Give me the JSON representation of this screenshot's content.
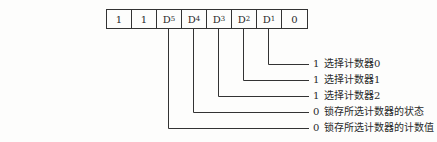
{
  "register": {
    "bits": [
      {
        "main": "1",
        "sub": ""
      },
      {
        "main": "1",
        "sub": ""
      },
      {
        "main": "D",
        "sub": "5"
      },
      {
        "main": "D",
        "sub": "4"
      },
      {
        "main": "D",
        "sub": "3"
      },
      {
        "main": "D",
        "sub": "2"
      },
      {
        "main": "D",
        "sub": "1"
      },
      {
        "main": "0",
        "sub": ""
      }
    ]
  },
  "annotations": [
    {
      "bit": "D1",
      "value": "1",
      "text": "选择计数器0"
    },
    {
      "bit": "D2",
      "value": "1",
      "text": "选择计数器1"
    },
    {
      "bit": "D3",
      "value": "1",
      "text": "选择计数器2"
    },
    {
      "bit": "D4",
      "value": "0",
      "text": "锁存所选计数器的状态"
    },
    {
      "bit": "D5",
      "value": "0",
      "text": "锁存所选计数器的计数值"
    }
  ],
  "colors": {
    "line": "#333333",
    "text": "#2a2a2a",
    "background": "#fdfdfc"
  }
}
